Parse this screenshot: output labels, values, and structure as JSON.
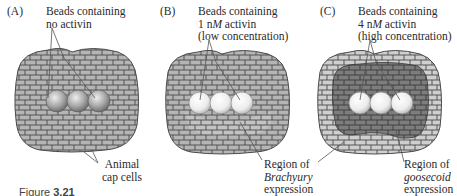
{
  "figure": {
    "caption_label": "Figure",
    "caption_number": "3.21",
    "panels": [
      {
        "letter": "(A)",
        "bead_label_line1": "Beads containing",
        "bead_label_line2": "no activin",
        "bead_label_line3": "",
        "side_label_line1": "Animal",
        "side_label_line2": "cap cells",
        "bead_color": "#a8a8a8"
      },
      {
        "letter": "(B)",
        "bead_label_line1": "Beads containing",
        "bead_label_line2_prefix": "1 n",
        "bead_label_line2_unit": "M",
        "bead_label_line2_suffix": " activin",
        "bead_label_line3": "(low concentration)",
        "side_label_line1": "Region of",
        "side_label_line2": "Brachyury",
        "side_label_line3": "expression",
        "bead_color": "#e6e6e6"
      },
      {
        "letter": "(C)",
        "bead_label_line1": "Beads containing",
        "bead_label_line2_prefix": "4 n",
        "bead_label_line2_unit": "M",
        "bead_label_line2_suffix": "  activin",
        "bead_label_line3": "(high concentration)",
        "side_label_line1": "Region of",
        "side_label_line2": "goosecoid",
        "side_label_line3": "expression",
        "bead_color": "#e6e6e6"
      }
    ],
    "colors": {
      "cell_fill": "#b5b5b5",
      "cell_outline": "#4a4a4a",
      "brachyury_fill": "#c8c8c8",
      "goosecoid_fill": "#7d7d7d",
      "leader_line": "#555555"
    }
  }
}
